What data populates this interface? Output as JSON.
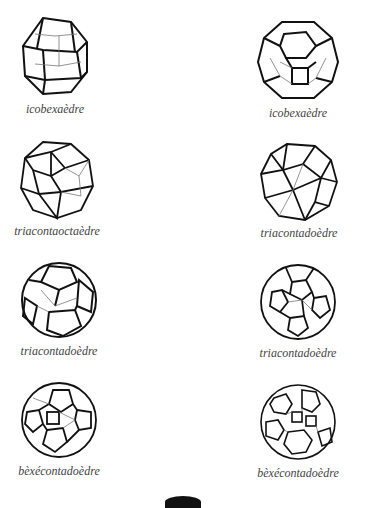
{
  "figures": [
    {
      "label": "icobexaèdre",
      "icon": "rhombicuboctahedron-icon"
    },
    {
      "label": "icobexaèdre",
      "icon": "truncated-cuboctahedron-icon"
    },
    {
      "label": "triacontaoctaèdre",
      "icon": "snub-cube-icon"
    },
    {
      "label": "triacontadoèdre",
      "icon": "icosidodecahedron-icon"
    },
    {
      "label": "triacontadoèdre",
      "icon": "truncated-dodecahedron-icon"
    },
    {
      "label": "triacontadoèdre",
      "icon": "truncated-icosahedron-icon"
    },
    {
      "label": "bèxécontadoèdre",
      "icon": "rhombicosidodecahedron-icon"
    },
    {
      "label": "bèxécontadoèdre",
      "icon": "truncated-icosidodecahedron-icon"
    }
  ],
  "colors": {
    "line": "#111111",
    "caption": "#444444",
    "background": "#ffffff"
  }
}
